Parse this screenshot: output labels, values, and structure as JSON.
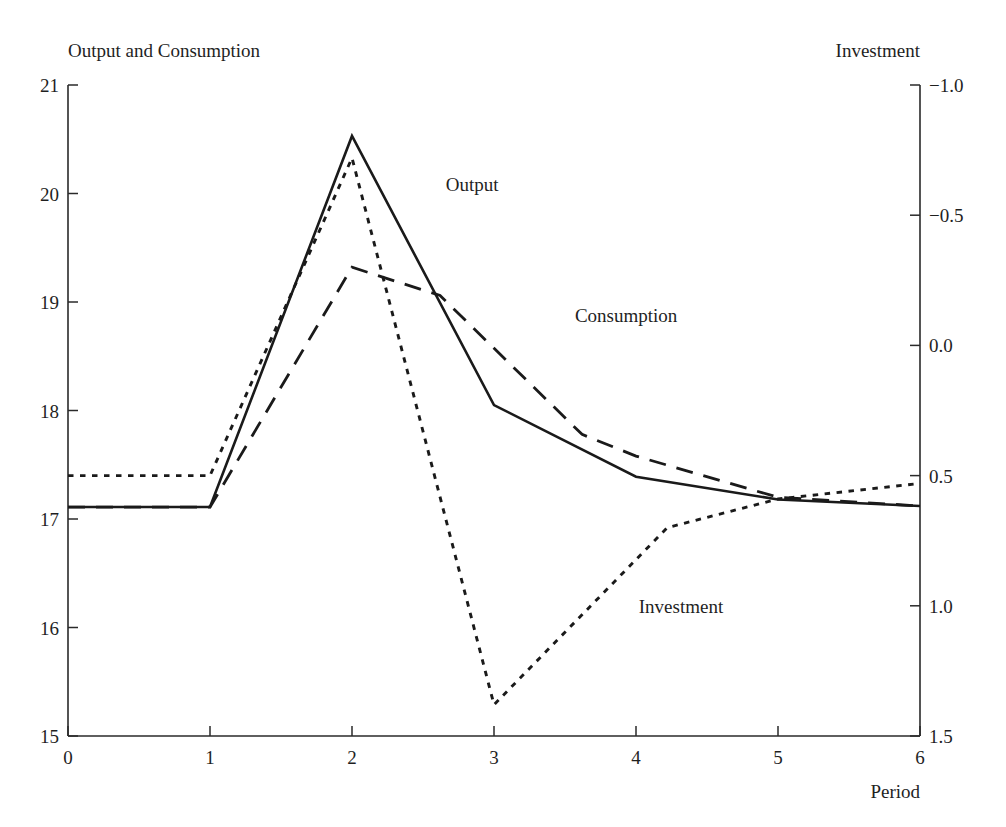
{
  "figure": {
    "left_axis_title": "Output and Consumption",
    "right_axis_title": "Investment",
    "xlabel": "Period"
  },
  "labels": {
    "output": "Output",
    "consumption": "Consumption",
    "investment": "Investment"
  },
  "axes": {
    "x_ticks": [
      "0",
      "1",
      "2",
      "3",
      "4",
      "5",
      "6"
    ],
    "y_left_ticks": [
      "21",
      "20",
      "19",
      "18",
      "17",
      "16",
      "15"
    ],
    "y_right_ticks": [
      "1.5",
      "1.0",
      "0.5",
      "0.0",
      "−0.5",
      "−1.0"
    ]
  },
  "chart_data": {
    "type": "line",
    "title": "",
    "subtitle": "",
    "xlabel": "Period",
    "ylabel": "Output and Consumption",
    "y2label": "Investment",
    "xlim": [
      0,
      6
    ],
    "ylim": [
      15,
      21
    ],
    "y2lim": [
      -1.0,
      1.5
    ],
    "grid": false,
    "legend": "inline-annotations",
    "x_ticks": [
      0,
      1,
      2,
      3,
      4,
      5,
      6
    ],
    "y_left_ticks": [
      15,
      16,
      17,
      18,
      19,
      20,
      21
    ],
    "y_right_ticks": [
      -1.0,
      -0.5,
      0.0,
      0.5,
      1.0,
      1.5
    ],
    "series": [
      {
        "name": "Output",
        "axis": "left",
        "style": "solid",
        "x": [
          0,
          1,
          2,
          3,
          4,
          5,
          6
        ],
        "values": [
          17.11,
          17.11,
          20.53,
          18.05,
          17.39,
          17.18,
          17.12
        ]
      },
      {
        "name": "Consumption",
        "axis": "left",
        "style": "dashed",
        "x": [
          0,
          1,
          2,
          2.62,
          3.62,
          4,
          5,
          6
        ],
        "values": [
          17.11,
          17.11,
          19.32,
          19.06,
          17.78,
          17.58,
          17.2,
          17.12
        ]
      },
      {
        "name": "Investment",
        "axis": "right",
        "style": "dotted",
        "x": [
          0,
          1,
          2,
          3,
          4.22,
          5,
          6
        ],
        "values": [
          0.0,
          0.0,
          1.22,
          -0.88,
          -0.2,
          -0.09,
          -0.03
        ]
      }
    ],
    "annotations": [
      {
        "text": "Output",
        "x": 2.66,
        "y_left": 20.02
      },
      {
        "text": "Consumption",
        "x": 3.57,
        "y_left": 18.82
      },
      {
        "text": "Investment",
        "x": 4.02,
        "y_left": 16.13
      }
    ]
  }
}
